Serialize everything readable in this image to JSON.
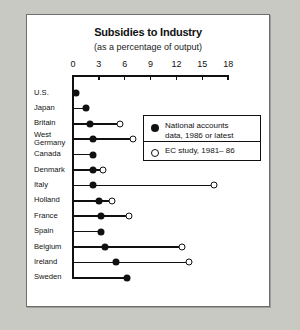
{
  "chart_data": {
    "type": "scatter",
    "title": "Subsidies to Industry",
    "subtitle": "(as a percentage of output)",
    "xlabel": "",
    "ylabel": "",
    "xlim": [
      0,
      18
    ],
    "xticks": [
      0,
      3,
      6,
      9,
      12,
      15,
      18
    ],
    "xtick_labels": [
      "0",
      "3",
      "6",
      "9",
      "12",
      "15",
      "18"
    ],
    "grid": false,
    "legend_position": "upper-right-inside",
    "categories": [
      "U.S.",
      "Japan",
      "Britain",
      "West Germany",
      "Canada",
      "Denmark",
      "Italy",
      "Holland",
      "France",
      "Spain",
      "Belgium",
      "Ireland",
      "Sweden"
    ],
    "series": [
      {
        "name": "National accounts data, 1986 or latest",
        "marker": "filled-circle",
        "values": [
          0.3,
          1.5,
          2.0,
          2.3,
          2.3,
          2.3,
          2.3,
          3.0,
          3.2,
          3.3,
          3.7,
          5.0,
          6.3
        ]
      },
      {
        "name": "EC study, 1981– 86",
        "marker": "open-circle",
        "values": [
          null,
          null,
          5.5,
          7.0,
          null,
          3.5,
          16.4,
          4.5,
          6.5,
          null,
          12.7,
          13.4,
          null
        ]
      }
    ],
    "legend": [
      {
        "marker": "filled-circle",
        "line1": "National accounts",
        "line2": "data, 1986 or latest"
      },
      {
        "marker": "open-circle",
        "line1": "EC study, 1981– 86",
        "line2": ""
      }
    ]
  },
  "colors": {
    "ink": "#111111",
    "panel": "#ffffff",
    "backdrop": "#c9c9c4"
  }
}
